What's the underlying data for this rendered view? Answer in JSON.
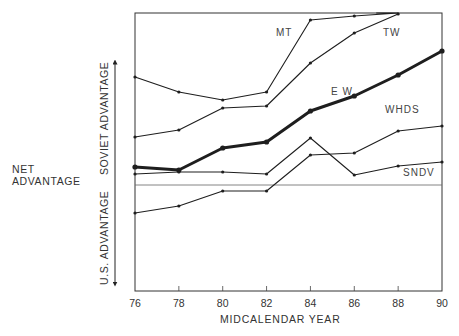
{
  "chart_data": {
    "type": "line",
    "title": "",
    "xlabel": "MIDCALENDAR YEAR",
    "ylabel": "NET ADVANTAGE",
    "ylabel_positive": "SOVIET ADVANTAGE",
    "ylabel_negative": "U.S. ADVANTAGE",
    "x": [
      76,
      78,
      80,
      82,
      84,
      86,
      88,
      90
    ],
    "x_tick_labels": [
      "76",
      "78",
      "80",
      "82",
      "84",
      "86",
      "88",
      "90"
    ],
    "ylim": [
      -10.6,
      17.2
    ],
    "y_units": "relative (no numeric ticks shown; 0 = parity line)",
    "grid": false,
    "legend": "inline labels",
    "series": [
      {
        "name": "MT",
        "values": [
          10.8,
          9.3,
          8.5,
          9.3,
          16.5,
          16.9,
          17.2,
          null
        ],
        "style": "thin"
      },
      {
        "name": "TW",
        "values": [
          4.8,
          5.5,
          7.7,
          7.9,
          12.2,
          15.2,
          17.1,
          null
        ],
        "style": "thin"
      },
      {
        "name": "EW",
        "values": [
          1.8,
          1.5,
          3.7,
          4.3,
          7.4,
          8.9,
          11.0,
          13.4
        ],
        "style": "bold"
      },
      {
        "name": "WHDS",
        "values": [
          -2.8,
          -2.1,
          -0.6,
          -0.6,
          3.0,
          3.2,
          5.4,
          5.9
        ],
        "style": "thin"
      },
      {
        "name": "SNDV",
        "values": [
          1.1,
          1.3,
          1.3,
          1.1,
          4.7,
          1.0,
          1.9,
          2.3
        ],
        "style": "thin"
      }
    ]
  },
  "labels": {
    "net_line1": "NET",
    "net_line2": "ADVANTAGE",
    "soviet": "SOVIET ADVANTAGE",
    "us": "U.S. ADVANTAGE",
    "xlabel": "MIDCALENDAR YEAR",
    "series": {
      "MT": "MT",
      "TW": "TW",
      "EW": "E W",
      "WHDS": "WHDS",
      "SNDV": "SNDV"
    }
  }
}
